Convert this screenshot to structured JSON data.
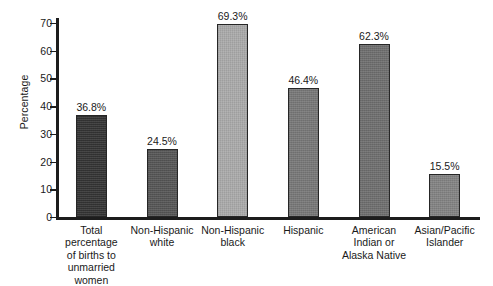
{
  "chart_data": {
    "type": "bar",
    "title": "",
    "xlabel": "",
    "ylabel": "Percentage",
    "ylim": [
      0,
      70
    ],
    "ytick_values": [
      0,
      10,
      20,
      30,
      40,
      50,
      60,
      70
    ],
    "ytick_labels": [
      "0",
      "10",
      "20",
      "30",
      "40",
      "50",
      "60",
      "70"
    ],
    "grid": false,
    "legend": "none",
    "categories": [
      "Total percentage of births to unmarried women",
      "Non-Hispanic white",
      "Non-Hispanic black",
      "Hispanic",
      "American Indian or Alaska Native",
      "Asian/Pacific Islander"
    ],
    "values": [
      36.8,
      24.5,
      69.3,
      46.4,
      62.3,
      15.5
    ],
    "value_labels": [
      "36.8%",
      "24.5%",
      "69.3%",
      "46.4%",
      "62.3%",
      "15.5%"
    ],
    "bar_colors": [
      "#333333",
      "#555555",
      "#aaaaaa",
      "#777777",
      "#6e6e6e",
      "#828282"
    ],
    "bar_edge_color": "#262626",
    "bars": [
      {
        "category": "Total percentage of births to unmarried women",
        "label_lines": [
          "Total",
          "percentage",
          "of births to",
          "unmarried women"
        ],
        "value": 36.8,
        "value_label": "36.8%",
        "color": "#333333"
      },
      {
        "category": "Non-Hispanic white",
        "label_lines": [
          "Non-Hispanic",
          "white"
        ],
        "value": 24.5,
        "value_label": "24.5%",
        "color": "#555555"
      },
      {
        "category": "Non-Hispanic black",
        "label_lines": [
          "Non-Hispanic",
          "black"
        ],
        "value": 69.3,
        "value_label": "69.3%",
        "color": "#aaaaaa"
      },
      {
        "category": "Hispanic",
        "label_lines": [
          "Hispanic"
        ],
        "value": 46.4,
        "value_label": "46.4%",
        "color": "#777777"
      },
      {
        "category": "American Indian or Alaska Native",
        "label_lines": [
          "American",
          "Indian or",
          "Alaska Native"
        ],
        "value": 62.3,
        "value_label": "62.3%",
        "color": "#6e6e6e"
      },
      {
        "category": "Asian/Pacific Islander",
        "label_lines": [
          "Asian/Pacific",
          "Islander"
        ],
        "value": 15.5,
        "value_label": "15.5%",
        "color": "#828282"
      }
    ]
  }
}
